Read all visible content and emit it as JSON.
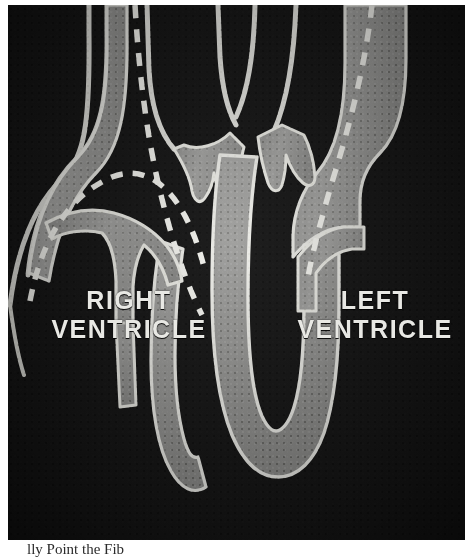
{
  "figure": {
    "kind": "anatomical-illustration",
    "plate_background_color": "#141414",
    "tissue_fill_color": "#9a9a9a",
    "outline_color": "#e6e6e2",
    "dashed_guide_color": "#f2f2ee",
    "page_background_color": "#ffffff"
  },
  "labels": {
    "right_ventricle": "RIGHT\nVENTRICLE",
    "left_ventricle": "LEFT\nVENTRICLE"
  },
  "caption": {
    "text": "lly Point the Fib"
  },
  "structures": [
    {
      "name": "great-vessel-left-outer",
      "description": "outlined vessel wall descending at far left"
    },
    {
      "name": "great-vessel-crossing-pair",
      "description": "two crossing vessel outlines at top center"
    },
    {
      "name": "semilunar-valve-cusps",
      "description": "cup-shaped valve leaflets at center"
    },
    {
      "name": "interventricular-septum",
      "description": "central grey wall descending to apex"
    },
    {
      "name": "right-ventricle-cavity",
      "description": "dark chamber left of septum"
    },
    {
      "name": "left-ventricle-cavity",
      "description": "dark chamber right of septum"
    },
    {
      "name": "atrioventricular-leaflet-right",
      "description": "grey leaflet hanging into right ventricle"
    },
    {
      "name": "left-ventricular-free-wall",
      "description": "thick grey wall at right"
    },
    {
      "name": "cardiac-apex",
      "description": "rounded grey apex at bottom"
    },
    {
      "name": "dashed-guide-left",
      "description": "dashed outline through right side of image"
    },
    {
      "name": "dashed-guide-right",
      "description": "dashed outline through left side of image"
    },
    {
      "name": "dashed-guide-arch",
      "description": "dashed arch over right ventricle"
    }
  ]
}
